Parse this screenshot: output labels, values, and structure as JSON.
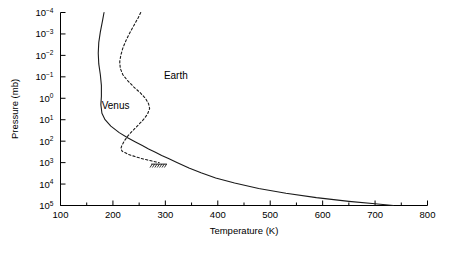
{
  "chart_data": {
    "type": "line",
    "title": "",
    "xlabel": "Temperature (K)",
    "ylabel": "Pressure (mb)",
    "xlim": [
      100,
      800
    ],
    "ylim_log_mb": [
      0.0001,
      100000
    ],
    "y_axis_inverted": true,
    "y_scale": "log",
    "grid": false,
    "legend": "inline-annotations",
    "x_ticks": [
      100,
      200,
      300,
      400,
      500,
      600,
      700,
      800
    ],
    "x_tick_labels": [
      "100",
      "200",
      "300",
      "400",
      "500",
      "600",
      "700",
      "800"
    ],
    "x_minor_ticks": [
      150,
      250,
      350,
      450,
      550,
      650,
      750
    ],
    "y_ticks_exponent": [
      -4,
      -3,
      -2,
      -1,
      0,
      1,
      2,
      3,
      4,
      5
    ],
    "y_tick_labels": [
      "10-4",
      "10-3",
      "10-2",
      "10-1",
      "100",
      "101",
      "102",
      "103",
      "104",
      "105"
    ],
    "annotations": [
      {
        "text": "Venus",
        "temperature_k": 205,
        "pressure_mb": 3,
        "name": "venus-curve-label"
      },
      {
        "text": "Earth",
        "temperature_k": 320,
        "pressure_mb": 0.12,
        "name": "earth-curve-label"
      }
    ],
    "surface_marker": {
      "label": "earth-surface-hatching",
      "pressure_mb": 1000,
      "temperature_range_k": [
        273,
        303
      ]
    },
    "series": [
      {
        "name": "Venus",
        "style": "solid",
        "color": "#1a1a1a",
        "points_t_p": [
          [
            183,
            0.0001
          ],
          [
            180,
            0.00025
          ],
          [
            176,
            0.0008
          ],
          [
            173,
            0.0025
          ],
          [
            172,
            0.008
          ],
          [
            173,
            0.025
          ],
          [
            176,
            0.08
          ],
          [
            178,
            0.25
          ],
          [
            178,
            0.8
          ],
          [
            177,
            2
          ],
          [
            179,
            5
          ],
          [
            185,
            10
          ],
          [
            196,
            20
          ],
          [
            212,
            40
          ],
          [
            228,
            70
          ],
          [
            243,
            110
          ],
          [
            256,
            160
          ],
          [
            268,
            230
          ],
          [
            281,
            330
          ],
          [
            293,
            470
          ],
          [
            306,
            650
          ],
          [
            322,
            1000
          ],
          [
            345,
            1800
          ],
          [
            368,
            3000
          ],
          [
            396,
            5200
          ],
          [
            432,
            9000
          ],
          [
            478,
            16000
          ],
          [
            530,
            27000
          ],
          [
            588,
            43000
          ],
          [
            650,
            64000
          ],
          [
            700,
            83000
          ],
          [
            735,
            100000
          ]
        ]
      },
      {
        "name": "Earth",
        "style": "dashed",
        "color": "#1a1a1a",
        "points_t_p": [
          [
            253,
            0.0001
          ],
          [
            248,
            0.00018
          ],
          [
            240,
            0.0004
          ],
          [
            232,
            0.0009
          ],
          [
            225,
            0.002
          ],
          [
            219,
            0.0045
          ],
          [
            215,
            0.01
          ],
          [
            213,
            0.02
          ],
          [
            214,
            0.04
          ],
          [
            219,
            0.08
          ],
          [
            228,
            0.15
          ],
          [
            240,
            0.3
          ],
          [
            252,
            0.55
          ],
          [
            262,
            1.0
          ],
          [
            268,
            1.8
          ],
          [
            270,
            3.0
          ],
          [
            266,
            5.5
          ],
          [
            258,
            10
          ],
          [
            248,
            18
          ],
          [
            238,
            32
          ],
          [
            229,
            55
          ],
          [
            222,
            95
          ],
          [
            217,
            160
          ],
          [
            215,
            230
          ],
          [
            218,
            300
          ],
          [
            230,
            420
          ],
          [
            245,
            550
          ],
          [
            258,
            680
          ],
          [
            270,
            800
          ],
          [
            280,
            910
          ],
          [
            288,
            1000
          ]
        ]
      }
    ]
  }
}
